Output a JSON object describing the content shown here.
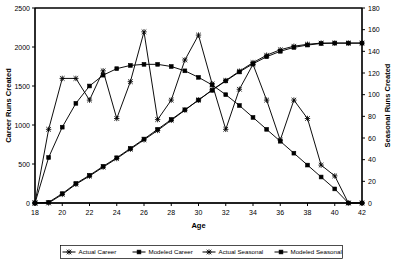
{
  "chart_data": {
    "type": "line",
    "title": "",
    "xlabel": "Age",
    "ylabel": "Career Runs Created",
    "y2label": "Seasonal Runs Created",
    "xlim": [
      18,
      42
    ],
    "ylim": [
      0,
      2500
    ],
    "y2lim": [
      0,
      180
    ],
    "xticks": [
      18,
      20,
      22,
      24,
      26,
      28,
      30,
      32,
      34,
      36,
      38,
      40,
      42
    ],
    "xticklabels": [
      "18",
      "20",
      "22",
      "24",
      "26",
      "28",
      "30",
      "32",
      "34",
      "36",
      "38",
      "40",
      "42"
    ],
    "yticks": [
      0,
      500,
      1000,
      1500,
      2000,
      2500
    ],
    "yticklabels": [
      "0",
      "500",
      "1000",
      "1500",
      "2000",
      "2500"
    ],
    "y2ticks": [
      0,
      20,
      40,
      60,
      80,
      100,
      120,
      140,
      160,
      180
    ],
    "y2ticklabels": [
      "0",
      "20",
      "40",
      "60",
      "80",
      "100",
      "120",
      "140",
      "160",
      "180"
    ],
    "grid": false,
    "legend_position": "bottom",
    "x": [
      18,
      19,
      20,
      21,
      22,
      23,
      24,
      25,
      26,
      27,
      28,
      29,
      30,
      31,
      32,
      33,
      34,
      35,
      36,
      37,
      38,
      39,
      40,
      41,
      42
    ],
    "series": [
      {
        "name": "Actual Career",
        "axis": "left",
        "marker": "star",
        "values": [
          0,
          0,
          110,
          240,
          345,
          460,
          570,
          690,
          810,
          930,
          1060,
          1190,
          1320,
          1450,
          1570,
          1690,
          1800,
          1895,
          1965,
          2010,
          2035,
          2050,
          2050,
          2050,
          2050
        ]
      },
      {
        "name": "Modeled Career",
        "axis": "left",
        "marker": "square",
        "values": [
          0,
          10,
          120,
          250,
          355,
          470,
          580,
          700,
          820,
          945,
          1070,
          1195,
          1320,
          1445,
          1565,
          1680,
          1785,
          1875,
          1945,
          1995,
          2025,
          2045,
          2050,
          2050,
          2050
        ]
      },
      {
        "name": "Actual Seasonal",
        "axis": "right",
        "marker": "star",
        "values": [
          0,
          68,
          115,
          115,
          95,
          122,
          78,
          112,
          158,
          77,
          95,
          132,
          155,
          110,
          68,
          105,
          128,
          95,
          58,
          95,
          78,
          35,
          25,
          0,
          0
        ]
      },
      {
        "name": "Modeled Seasonal",
        "axis": "right",
        "marker": "square",
        "values": [
          0,
          42,
          70,
          92,
          108,
          118,
          124,
          127,
          128,
          128,
          126,
          122,
          116,
          109,
          100,
          90,
          79,
          68,
          57,
          46,
          35,
          24,
          13,
          0,
          0
        ]
      }
    ],
    "legend": [
      {
        "label": "Actual Career",
        "marker": "star"
      },
      {
        "label": "Modeled Career",
        "marker": "square"
      },
      {
        "label": "Actual Seasonal",
        "marker": "star"
      },
      {
        "label": "Modeled Seasonal",
        "marker": "square"
      }
    ],
    "colors": {
      "line": "#000000",
      "axis": "#000000",
      "background": "#ffffff"
    }
  }
}
